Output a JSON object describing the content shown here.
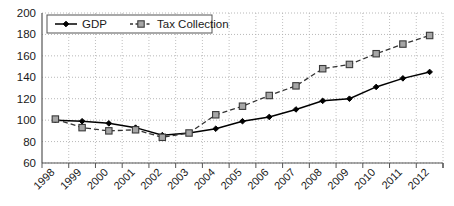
{
  "chart_data": {
    "type": "line",
    "title": "",
    "subtitle": "",
    "xlabel": "",
    "ylabel": "",
    "categories": [
      "1998",
      "1999",
      "2000",
      "2001",
      "2002",
      "2003",
      "2004",
      "2005",
      "2006",
      "2007",
      "2008",
      "2009",
      "2010",
      "2011",
      "2012"
    ],
    "series": [
      {
        "name": "GDP",
        "marker": "diamond",
        "line_style": "solid",
        "color": "#000000",
        "values": [
          100,
          99,
          97,
          93,
          86,
          88,
          92,
          99,
          103,
          110,
          118,
          120,
          131,
          139,
          145
        ]
      },
      {
        "name": "Tax Collection",
        "marker": "square",
        "line_style": "dashed",
        "color": "#333333",
        "marker_fill": "#a6a6a6",
        "values": [
          101,
          93,
          90,
          91,
          84,
          88,
          105,
          113,
          123,
          132,
          148,
          152,
          162,
          171,
          179
        ]
      }
    ],
    "ylim": [
      60,
      200
    ],
    "yticks": [
      60,
      80,
      100,
      120,
      140,
      160,
      180,
      200
    ],
    "ytick_labels": [
      "60",
      "80",
      "100",
      "120",
      "140",
      "160",
      "180",
      "200"
    ],
    "grid": true,
    "grid_style": "dotted",
    "grid_color": "#b0b0b0",
    "legend_position": "top-left",
    "legend_border": true,
    "xtick_rotation": -45,
    "axis_color": "#555555"
  },
  "legend": {
    "entries": [
      {
        "label": "GDP"
      },
      {
        "label": "Tax Collection"
      }
    ]
  }
}
